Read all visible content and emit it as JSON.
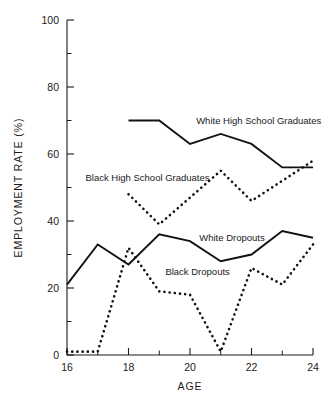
{
  "chart_data": {
    "type": "line",
    "title": "",
    "xlabel": "AGE",
    "ylabel": "EMPLOYMENT RATE (%)",
    "xlim": [
      16,
      24
    ],
    "ylim": [
      0,
      100
    ],
    "x_ticks": [
      16,
      17,
      18,
      19,
      20,
      21,
      22,
      23,
      24
    ],
    "x_tick_labels": [
      "16",
      "",
      "18",
      "",
      "20",
      "",
      "22",
      "",
      "24"
    ],
    "y_ticks": [
      0,
      10,
      20,
      30,
      40,
      50,
      60,
      70,
      80,
      90,
      100
    ],
    "y_tick_labels": [
      "0",
      "",
      "20",
      "",
      "40",
      "",
      "60",
      "",
      "80",
      "",
      "100"
    ],
    "grid": false,
    "legend": "inline-annotations",
    "series": [
      {
        "name": "White High School Graduates",
        "style": "solid",
        "label_x": 20.2,
        "label_y": 69,
        "x": [
          18,
          19,
          20,
          21,
          22,
          23,
          24
        ],
        "values": [
          70,
          70,
          63,
          66,
          63,
          56,
          56
        ]
      },
      {
        "name": "Black High School Graduates",
        "style": "dotted",
        "label_x": 16.6,
        "label_y": 52,
        "x": [
          18,
          19,
          20,
          21,
          22,
          23,
          24
        ],
        "values": [
          48,
          39,
          47,
          55,
          46,
          52,
          58
        ]
      },
      {
        "name": "White Dropouts",
        "style": "solid",
        "label_x": 20.3,
        "label_y": 34,
        "x": [
          16,
          17,
          18,
          19,
          20,
          21,
          22,
          23,
          24
        ],
        "values": [
          21,
          33,
          27,
          36,
          34,
          28,
          30,
          37,
          35
        ]
      },
      {
        "name": "Black Dropouts",
        "style": "dotted",
        "label_x": 19.2,
        "label_y": 24,
        "x": [
          16,
          17,
          18,
          19,
          20,
          21,
          22,
          23,
          24
        ],
        "values": [
          1,
          1,
          32,
          19,
          18,
          1,
          26,
          21,
          33
        ]
      }
    ]
  }
}
